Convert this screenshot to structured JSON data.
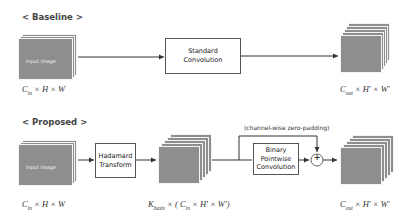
{
  "baseline": {
    "title": "< Baseline >",
    "input_label": "Input image",
    "op_box": [
      "Standard",
      "Convolution"
    ],
    "input_dims": {
      "base": "C",
      "sub": "in",
      "rest": " × H × W"
    },
    "output_dims": {
      "base": "C",
      "sub": "out",
      "rest": " × H' × W'"
    }
  },
  "proposed": {
    "title": "< Proposed >",
    "input_label": "Input image",
    "transform_box": [
      "Hadamard",
      "Transform"
    ],
    "binary_box": [
      "Binary",
      "Pointwise",
      "Convolution"
    ],
    "skip_note": "(channel-wise zero-padding)",
    "adder_symbol": "+",
    "input_dims": {
      "base": "C",
      "sub": "in",
      "rest": " × H × W"
    },
    "mid_dims": {
      "base": "K",
      "sub": "basis",
      "rest1": " × ( ",
      "base2": "C",
      "sub2": "in",
      "rest2": " × H' × W')"
    },
    "output_dims": {
      "base": "C",
      "sub": "out",
      "rest": " × H' × W'"
    }
  },
  "colors": {
    "tensor_fill": "#8e8e8e",
    "line": "#333333",
    "box_border": "#555555"
  }
}
